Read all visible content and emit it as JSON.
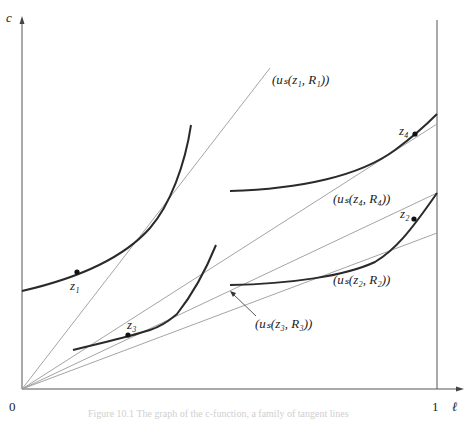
{
  "figure": {
    "axes": {
      "y_label": "c",
      "x_label": "ℓ",
      "origin_label": "0",
      "x_tick_label": "1"
    },
    "points": [
      {
        "name": "z1",
        "label": "z₁"
      },
      {
        "name": "z2",
        "label": "z₂"
      },
      {
        "name": "z3",
        "label": "z₃"
      },
      {
        "name": "z4",
        "label": "z₄"
      }
    ],
    "tangent_labels": {
      "l1": "(uₛ(z₁, R₁))",
      "l2": "(uₛ(z₂, R₂))",
      "l3": "(uₛ(z₃, R₃))",
      "l4": "(uₛ(z₄, R₄))"
    },
    "caption": "Figure 10.1  The graph of the c-function, a family of tangent lines"
  },
  "colors": {
    "curve": "#2a2a2a",
    "tangent": "#9a9a9a",
    "axis": "#555555"
  }
}
